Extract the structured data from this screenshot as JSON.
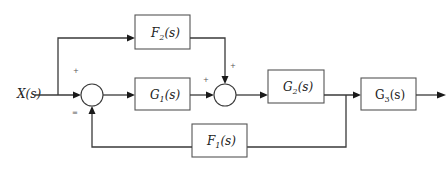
{
  "diagram": {
    "type": "control-system-block-diagram",
    "input": {
      "label": "X(s)"
    },
    "blocks": [
      {
        "id": "F2",
        "name": "F",
        "sub": "2",
        "arg": "(s)",
        "label": "F2(s)"
      },
      {
        "id": "G1",
        "name": "G",
        "sub": "1",
        "arg": "(s)",
        "label": "G1(s)"
      },
      {
        "id": "G2",
        "name": "G",
        "sub": "2",
        "arg": "(s)",
        "label": "G2(s)"
      },
      {
        "id": "G3",
        "name": "G",
        "sub": "3",
        "arg": "(s)",
        "label": "G3(s)"
      },
      {
        "id": "F1",
        "name": "F",
        "sub": "1",
        "arg": "(s)",
        "label": "F1(s)"
      }
    ],
    "summing_junctions": [
      {
        "id": "sum1",
        "signs": {
          "input": "+",
          "feedback": "="
        }
      },
      {
        "id": "sum2",
        "signs": {
          "forward": "+",
          "feedforward": "+"
        }
      }
    ],
    "connections": [
      "X(s) -> sum1",
      "X(s) -> F2(s) -> sum2",
      "sum1 -> G1(s) -> sum2",
      "sum2 -> G2(s) -> G3(s) -> output",
      "G2 output -> F1(s) -> sum1 (feedback)"
    ]
  }
}
